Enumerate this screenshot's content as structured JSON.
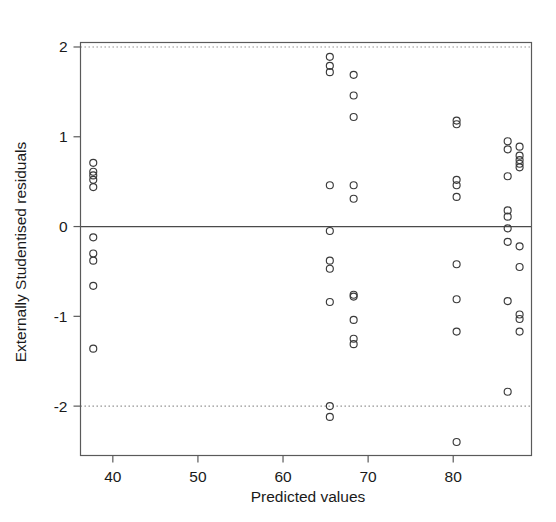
{
  "chart_data": {
    "type": "scatter",
    "title": "",
    "xlabel": "Predicted values",
    "ylabel": "Externally Studentised residuals",
    "xlim": [
      36.2,
      89.2
    ],
    "ylim": [
      -2.55,
      2.05
    ],
    "xticks": [
      40,
      50,
      60,
      70,
      80
    ],
    "xtick_labels": [
      "40",
      "50",
      "60",
      "70",
      "80"
    ],
    "yticks": [
      -2,
      -1,
      0,
      1,
      2
    ],
    "ytick_labels": [
      "-2",
      "-1",
      "0",
      "1",
      "2"
    ],
    "grid": false,
    "legend": "none",
    "marker": "open-circle",
    "marker_color": "#3a3a3a",
    "reference_lines": [
      {
        "name": "zero-line",
        "axis": "y",
        "value": 0,
        "style": "solid",
        "color": "#4a4a4a"
      },
      {
        "name": "upper-bound-line",
        "axis": "y",
        "value": 2,
        "style": "dotted",
        "color": "#8a8a8a"
      },
      {
        "name": "lower-bound-line",
        "axis": "y",
        "value": -2,
        "style": "dotted",
        "color": "#8a8a8a"
      }
    ],
    "points": [
      [
        37.7,
        0.71
      ],
      [
        37.7,
        0.61
      ],
      [
        37.7,
        0.57
      ],
      [
        37.7,
        0.52
      ],
      [
        37.7,
        0.44
      ],
      [
        37.7,
        -0.12
      ],
      [
        37.7,
        -0.3
      ],
      [
        37.7,
        -0.38
      ],
      [
        37.7,
        -0.66
      ],
      [
        37.7,
        -1.36
      ],
      [
        65.5,
        1.89
      ],
      [
        65.5,
        1.79
      ],
      [
        65.5,
        1.72
      ],
      [
        65.5,
        0.46
      ],
      [
        65.5,
        -0.05
      ],
      [
        65.5,
        -0.38
      ],
      [
        65.5,
        -0.47
      ],
      [
        65.5,
        -0.84
      ],
      [
        65.5,
        -2.0
      ],
      [
        65.5,
        -2.12
      ],
      [
        68.3,
        1.69
      ],
      [
        68.3,
        1.46
      ],
      [
        68.3,
        1.22
      ],
      [
        68.3,
        0.46
      ],
      [
        68.3,
        0.31
      ],
      [
        68.3,
        -0.76
      ],
      [
        68.3,
        -0.78
      ],
      [
        68.3,
        -1.04
      ],
      [
        68.3,
        -1.25
      ],
      [
        68.3,
        -1.31
      ],
      [
        80.4,
        1.18
      ],
      [
        80.4,
        1.14
      ],
      [
        80.4,
        0.52
      ],
      [
        80.4,
        0.46
      ],
      [
        80.4,
        0.33
      ],
      [
        80.4,
        -0.42
      ],
      [
        80.4,
        -0.81
      ],
      [
        80.4,
        -1.17
      ],
      [
        80.4,
        -2.4
      ],
      [
        86.4,
        0.95
      ],
      [
        86.4,
        0.86
      ],
      [
        86.4,
        0.56
      ],
      [
        86.4,
        0.18
      ],
      [
        86.4,
        0.11
      ],
      [
        86.4,
        -0.02
      ],
      [
        86.4,
        -0.17
      ],
      [
        86.4,
        -0.83
      ],
      [
        86.4,
        -1.84
      ],
      [
        87.8,
        0.89
      ],
      [
        87.8,
        0.79
      ],
      [
        87.8,
        0.74
      ],
      [
        87.8,
        0.7
      ],
      [
        87.8,
        0.66
      ],
      [
        87.8,
        -0.22
      ],
      [
        87.8,
        -0.45
      ],
      [
        87.8,
        -0.98
      ],
      [
        87.8,
        -1.03
      ],
      [
        87.8,
        -1.17
      ]
    ]
  }
}
